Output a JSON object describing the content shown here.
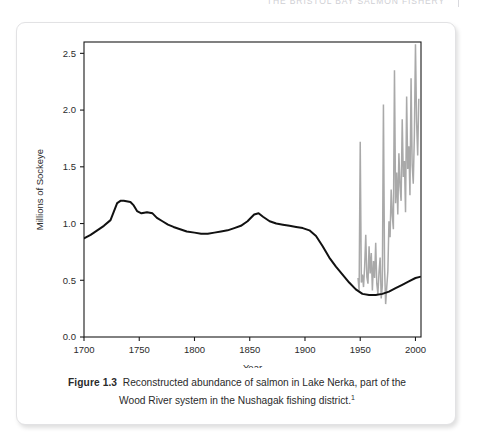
{
  "page": {
    "header_text": "THE BRISTOL BAY SALMON FISHERY",
    "header_rule": ""
  },
  "figure": {
    "caption_label": "Figure 1.3",
    "caption_text": "Reconstructed abundance of salmon in Lake Nerka, part of the Wood River system in the Nushagak fishing district.",
    "caption_footnote": "1"
  },
  "colors": {
    "reconstruction_line": "#111111",
    "annual_line": "#a9a9a9",
    "axis": "#1a1a1a",
    "card_border": "#e2e2e4",
    "page_background": "#ffffff",
    "header_text": "#cfcfd4"
  },
  "chart_data": {
    "type": "line",
    "title": "",
    "xlabel": "Year",
    "ylabel": "Millions of Sockeye",
    "xlim": [
      1700,
      2005
    ],
    "ylim": [
      0.0,
      2.6
    ],
    "grid": false,
    "legend": "none",
    "xticks": [
      1700,
      1750,
      1800,
      1850,
      1900,
      1950,
      2000
    ],
    "xtick_labels": [
      "1700",
      "1750",
      "1800",
      "1850",
      "1900",
      "1950",
      "2000"
    ],
    "yticks": [
      0.0,
      0.5,
      1.0,
      1.5,
      2.0,
      2.5
    ],
    "ytick_labels": [
      "0.0",
      "0.5",
      "1.0",
      "1.5",
      "2.0",
      "2.5"
    ],
    "series": [
      {
        "name": "Reconstructed abundance (smoothed)",
        "color": "#111111",
        "x": [
          1700,
          1706,
          1712,
          1718,
          1724,
          1730,
          1733,
          1736,
          1742,
          1745,
          1748,
          1752,
          1757,
          1762,
          1766,
          1771,
          1776,
          1781,
          1787,
          1793,
          1800,
          1806,
          1812,
          1818,
          1824,
          1830,
          1836,
          1842,
          1848,
          1854,
          1858,
          1862,
          1868,
          1874,
          1880,
          1886,
          1892,
          1898,
          1904,
          1910,
          1916,
          1922,
          1928,
          1934,
          1940,
          1946,
          1952,
          1958,
          1964,
          1970,
          1976,
          1982,
          1988,
          1994,
          2000,
          2004
        ],
        "y": [
          0.87,
          0.9,
          0.94,
          0.98,
          1.03,
          1.18,
          1.2,
          1.2,
          1.19,
          1.16,
          1.11,
          1.09,
          1.1,
          1.09,
          1.05,
          1.02,
          0.99,
          0.97,
          0.95,
          0.93,
          0.92,
          0.91,
          0.91,
          0.92,
          0.93,
          0.94,
          0.96,
          0.98,
          1.02,
          1.08,
          1.09,
          1.06,
          1.02,
          1.0,
          0.99,
          0.98,
          0.97,
          0.96,
          0.94,
          0.89,
          0.8,
          0.7,
          0.62,
          0.55,
          0.48,
          0.42,
          0.38,
          0.37,
          0.37,
          0.38,
          0.4,
          0.43,
          0.46,
          0.49,
          0.52,
          0.53
        ]
      },
      {
        "name": "Annual escapement / run (observed)",
        "color": "#a9a9a9",
        "x": [
          1948,
          1949,
          1950,
          1951,
          1952,
          1953,
          1954,
          1955,
          1956,
          1957,
          1958,
          1959,
          1960,
          1961,
          1962,
          1963,
          1964,
          1965,
          1966,
          1967,
          1968,
          1969,
          1970,
          1971,
          1972,
          1973,
          1974,
          1975,
          1976,
          1977,
          1978,
          1979,
          1980,
          1981,
          1982,
          1983,
          1984,
          1985,
          1986,
          1987,
          1988,
          1989,
          1990,
          1991,
          1992,
          1993,
          1994,
          1995,
          1996,
          1997,
          1998,
          1999,
          2000,
          2001,
          2002,
          2003
        ],
        "y": [
          0.52,
          0.41,
          1.72,
          0.48,
          0.55,
          0.44,
          0.62,
          0.9,
          0.53,
          0.47,
          0.8,
          0.56,
          0.74,
          0.41,
          0.67,
          0.52,
          0.83,
          0.47,
          0.38,
          0.57,
          0.7,
          0.34,
          0.45,
          2.05,
          0.62,
          0.29,
          0.44,
          0.58,
          1.02,
          0.88,
          1.3,
          1.07,
          0.95,
          2.35,
          1.18,
          1.45,
          1.08,
          1.62,
          1.33,
          1.2,
          1.92,
          1.41,
          1.55,
          1.1,
          2.12,
          1.48,
          1.68,
          1.25,
          2.28,
          1.52,
          1.35,
          1.78,
          2.58,
          1.9,
          1.6,
          2.1
        ]
      }
    ]
  }
}
